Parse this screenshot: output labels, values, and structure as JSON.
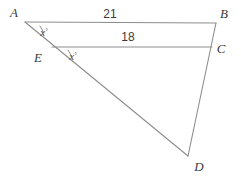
{
  "figure": {
    "type": "geometry-diagram",
    "background_color": "#ffffff",
    "line_color": "#8d8d8d",
    "text_color": "#3a3a3a",
    "vertices": [
      {
        "id": "A",
        "label": "A",
        "x": 25,
        "y": 22,
        "label_x": 14,
        "label_y": 17
      },
      {
        "id": "B",
        "label": "B",
        "x": 216,
        "y": 23,
        "label_x": 221,
        "label_y": 18
      },
      {
        "id": "C",
        "label": "C",
        "x": 212,
        "y": 47,
        "label_x": 218,
        "label_y": 53
      },
      {
        "id": "D",
        "label": "D",
        "x": 188,
        "y": 156,
        "label_x": 196,
        "label_y": 170
      },
      {
        "id": "E",
        "label": "E",
        "x": 52,
        "y": 47,
        "label_x": 36,
        "label_y": 62
      }
    ],
    "segments": [
      {
        "id": "AB",
        "from": "A",
        "to": "B"
      },
      {
        "id": "EC",
        "from": "E",
        "to": "C"
      },
      {
        "id": "AD",
        "from": "A",
        "to": "D"
      },
      {
        "id": "BD",
        "from": "B",
        "to": "D"
      }
    ],
    "measure_labels": [
      {
        "id": "AB-length",
        "text": "21",
        "x": 110,
        "y": 18
      },
      {
        "id": "EC-length",
        "text": "18",
        "x": 128,
        "y": 40
      }
    ],
    "angle_labels": [
      {
        "id": "angle-A",
        "text": "x",
        "degree": "°",
        "x": 42,
        "y": 36
      },
      {
        "id": "angle-E",
        "text": "x",
        "degree": "°",
        "x": 70,
        "y": 60
      }
    ]
  }
}
